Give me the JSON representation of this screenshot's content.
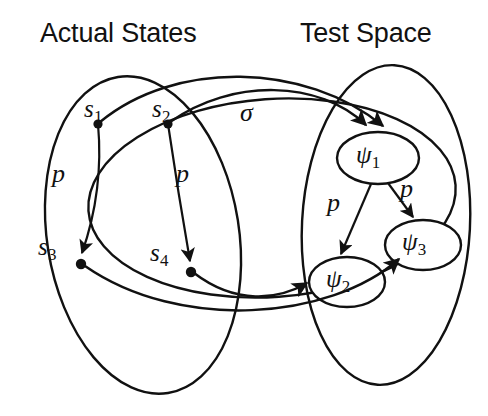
{
  "figure": {
    "type": "diagram",
    "background_color": "#ffffff",
    "stroke_color": "#111111"
  },
  "titles": {
    "left": "Actual States",
    "right": "Test Space"
  },
  "regions": [
    {
      "id": "actual-states-region",
      "name": "Actual States",
      "shape": "ellipse"
    },
    {
      "id": "test-space-region",
      "name": "Test Space",
      "shape": "ellipse"
    }
  ],
  "states": [
    {
      "id": "s1",
      "base": "s",
      "sub": "1",
      "x": 104,
      "y": 113
    },
    {
      "id": "s2",
      "base": "s",
      "sub": "2",
      "x": 175,
      "y": 113
    },
    {
      "id": "s3",
      "base": "s",
      "sub": "3",
      "x": 62,
      "y": 245
    },
    {
      "id": "s4",
      "base": "s",
      "sub": "4",
      "x": 175,
      "y": 253
    }
  ],
  "test_nodes": [
    {
      "id": "psi1",
      "base": "ψ",
      "sub": "1",
      "x": 378,
      "y": 157
    },
    {
      "id": "psi2",
      "base": "ψ",
      "sub": "2",
      "x": 347,
      "y": 281
    },
    {
      "id": "psi3",
      "base": "ψ",
      "sub": "3",
      "x": 422,
      "y": 244
    }
  ],
  "edge_labels": {
    "sigma": "σ",
    "p": "p"
  },
  "edges": [
    {
      "id": "edge-s1-s3",
      "from": "s1",
      "to": "s3",
      "label": "p"
    },
    {
      "id": "edge-s2-s4",
      "from": "s2",
      "to": "s4",
      "label": "p"
    },
    {
      "id": "edge-psi1-psi2",
      "from": "psi1",
      "to": "psi2",
      "label": "p"
    },
    {
      "id": "edge-psi1-psi3",
      "from": "psi1",
      "to": "psi3",
      "label": "p"
    },
    {
      "id": "edge-s1-psi1",
      "from": "s1",
      "to": "psi1",
      "label": "σ"
    },
    {
      "id": "edge-s2-psi1",
      "from": "s2",
      "to": "psi1",
      "label": "σ"
    },
    {
      "id": "edge-s4-psi2",
      "from": "s4",
      "to": "psi2",
      "label": "σ"
    },
    {
      "id": "edge-s3-psi3",
      "from": "s3",
      "to": "psi3",
      "label": "σ"
    }
  ],
  "label_positions": {
    "p_left": {
      "x": 58,
      "y": 177
    },
    "p_mid": {
      "x": 182,
      "y": 177
    },
    "p_psi2": {
      "x": 333,
      "y": 192
    },
    "p_psi3": {
      "x": 405,
      "y": 182
    },
    "sigma": {
      "x": 248,
      "y": 101
    }
  }
}
